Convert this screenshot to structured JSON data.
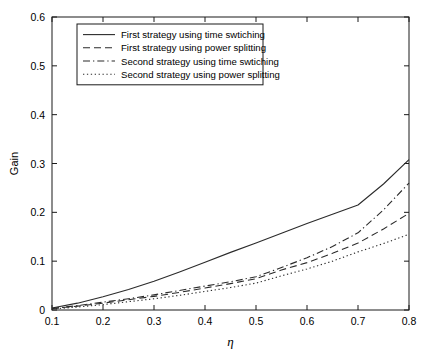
{
  "chart_data": {
    "type": "line",
    "title": "",
    "xlabel": "η",
    "ylabel": "Gain",
    "xlim": [
      0.1,
      0.8
    ],
    "ylim": [
      0,
      0.6
    ],
    "xticks": [
      "0.1",
      "0.2",
      "0.3",
      "0.4",
      "0.5",
      "0.6",
      "0.7",
      "0.8"
    ],
    "xtick_values": [
      0.1,
      0.2,
      0.3,
      0.4,
      0.5,
      0.6,
      0.7,
      0.8
    ],
    "yticks": [
      "0",
      "0.1",
      "0.2",
      "0.3",
      "0.4",
      "0.5",
      "0.6"
    ],
    "ytick_values": [
      0,
      0.1,
      0.2,
      0.3,
      0.4,
      0.5,
      0.6
    ],
    "grid": false,
    "legend_position": "upper left",
    "x": [
      0.1,
      0.15,
      0.2,
      0.25,
      0.3,
      0.35,
      0.4,
      0.45,
      0.5,
      0.55,
      0.6,
      0.65,
      0.7,
      0.75,
      0.8
    ],
    "series": [
      {
        "name": "First strategy using time swtiching",
        "style": "solid",
        "values": [
          0.004,
          0.014,
          0.027,
          0.042,
          0.059,
          0.078,
          0.098,
          0.118,
          0.137,
          0.157,
          0.177,
          0.196,
          0.215,
          0.258,
          0.308
        ]
      },
      {
        "name": "First strategy using power splitting",
        "style": "dashed",
        "values": [
          0.003,
          0.008,
          0.014,
          0.021,
          0.028,
          0.036,
          0.045,
          0.054,
          0.064,
          0.082,
          0.097,
          0.116,
          0.137,
          0.166,
          0.198
        ]
      },
      {
        "name": "Second strategy using time swtiching",
        "style": "dashdot",
        "values": [
          0.003,
          0.009,
          0.016,
          0.023,
          0.031,
          0.04,
          0.049,
          0.058,
          0.068,
          0.087,
          0.107,
          0.13,
          0.158,
          0.205,
          0.26
        ]
      },
      {
        "name": "Second strategy using power splitting",
        "style": "dotted",
        "values": [
          0.002,
          0.006,
          0.011,
          0.017,
          0.023,
          0.03,
          0.038,
          0.046,
          0.055,
          0.07,
          0.084,
          0.1,
          0.119,
          0.136,
          0.155
        ]
      }
    ]
  }
}
